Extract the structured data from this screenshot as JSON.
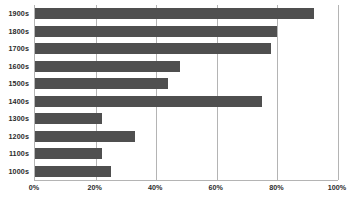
{
  "chart_data": {
    "type": "bar",
    "orientation": "horizontal",
    "title": "",
    "subtitle": "",
    "xlabel": "",
    "ylabel": "",
    "categories": [
      "1900s",
      "1800s",
      "1700s",
      "1600s",
      "1500s",
      "1400s",
      "1300s",
      "1200s",
      "1100s",
      "1000s"
    ],
    "values": [
      92,
      80,
      78,
      48,
      44,
      75,
      22,
      33,
      22,
      25
    ],
    "value_suffix": "%",
    "xlim": [
      0,
      100
    ],
    "xticks": [
      0,
      20,
      40,
      60,
      80,
      100
    ],
    "xtick_labels": [
      "0%",
      "20%",
      "40%",
      "60%",
      "80%",
      "100%"
    ],
    "grid": "vertical",
    "legend": "none",
    "bar_color": "#4f4f4f",
    "axis_color": "#b4b4b4",
    "background_color": "#ffffff"
  }
}
